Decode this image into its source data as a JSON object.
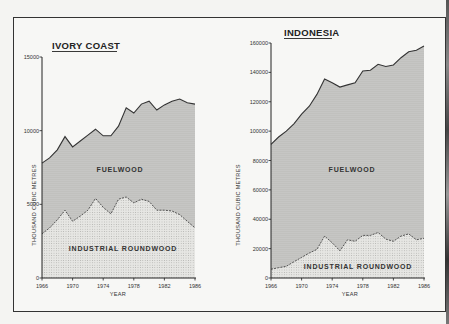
{
  "chart_data": [
    {
      "type": "area",
      "title": "IVORY COAST",
      "xlabel": "YEAR",
      "ylabel": "THOUSAND CUBIC METRES",
      "ylim": [
        0,
        15000
      ],
      "yticks": [
        0,
        5000,
        10000,
        15000
      ],
      "xticks": [
        1966,
        1970,
        1974,
        1978,
        1982,
        1986
      ],
      "x": [
        1966,
        1967,
        1968,
        1969,
        1970,
        1971,
        1972,
        1973,
        1974,
        1975,
        1976,
        1977,
        1978,
        1979,
        1980,
        1981,
        1982,
        1983,
        1984,
        1985,
        1986
      ],
      "series": [
        {
          "name": "FUELWOOD",
          "stacked_total": true,
          "values": [
            7800,
            8150,
            8700,
            9600,
            8900,
            9300,
            9700,
            10100,
            9650,
            9650,
            10300,
            11550,
            11200,
            11800,
            12000,
            11400,
            11750,
            12000,
            12150,
            11900,
            11800
          ]
        },
        {
          "name": "INDUSTRIAL ROUNDWOOD",
          "values": [
            3000,
            3400,
            3950,
            4600,
            3850,
            4200,
            4600,
            5400,
            4800,
            4350,
            5350,
            5500,
            5100,
            5350,
            5200,
            4600,
            4600,
            4550,
            4300,
            3850,
            3400
          ]
        }
      ],
      "area_labels": [
        "FUELWOOD",
        "INDUSTRIAL ROUNDWOOD"
      ],
      "grid": false
    },
    {
      "type": "area",
      "title": "INDONESIA",
      "xlabel": "YEAR",
      "ylabel": "THOUSAND CUBIC METRES",
      "ylim": [
        0,
        160000
      ],
      "yticks": [
        0,
        20000,
        40000,
        60000,
        80000,
        100000,
        120000,
        140000,
        160000
      ],
      "xticks": [
        1966,
        1970,
        1974,
        1978,
        1982,
        1986
      ],
      "x": [
        1966,
        1967,
        1968,
        1969,
        1970,
        1971,
        1972,
        1973,
        1974,
        1975,
        1976,
        1977,
        1978,
        1979,
        1980,
        1981,
        1982,
        1983,
        1984,
        1985,
        1986
      ],
      "series": [
        {
          "name": "FUELWOOD",
          "stacked_total": true,
          "values": [
            91000,
            96000,
            100000,
            105000,
            111500,
            117000,
            125000,
            135500,
            133000,
            130000,
            131500,
            133000,
            141000,
            141500,
            145500,
            144000,
            145000,
            150000,
            154000,
            155000,
            158000
          ]
        },
        {
          "name": "INDUSTRIAL ROUNDWOOD",
          "values": [
            6000,
            7000,
            8000,
            11000,
            14000,
            17000,
            19500,
            28500,
            24000,
            18500,
            26000,
            25000,
            29000,
            29000,
            31000,
            26500,
            25000,
            28500,
            30000,
            26000,
            27000
          ]
        }
      ],
      "area_labels": [
        "FUELWOOD",
        "INDUSTRIAL ROUNDWOOD"
      ],
      "grid": false
    }
  ],
  "colors": {
    "fuelwood_fill": "#c9c9c6",
    "industrial_fill": "#e2e2df",
    "line": "#333333"
  }
}
